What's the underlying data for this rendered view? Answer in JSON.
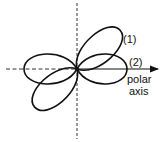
{
  "diagram": {
    "title": "",
    "axes": {
      "vertical": {
        "style": "dashed"
      },
      "horizontal": {
        "style": "dashed-left, solid-right with arrow"
      }
    },
    "curves": [
      {
        "id": "1",
        "label": "(1)",
        "shape": "lemniscate (figure-eight) tilted ~45°",
        "color": "#111111"
      },
      {
        "id": "2",
        "label": "(2)",
        "shape": "lemniscate (figure-eight) along polar axis",
        "color": "#111111"
      }
    ],
    "polar_axis_label": {
      "line1": "polar",
      "line2": "axis"
    }
  }
}
